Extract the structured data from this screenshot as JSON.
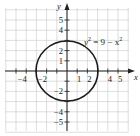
{
  "chart_data": {
    "type": "line",
    "title": "",
    "equation": "y² = 9 − x²",
    "curve": {
      "shape": "circle",
      "center": [
        0,
        0
      ],
      "radius": 3
    },
    "xlabel": "x",
    "ylabel": "y",
    "xlim": [
      -6,
      6
    ],
    "ylim": [
      -6,
      6
    ],
    "grid": true,
    "x_ticks": [
      -4,
      -2,
      1,
      2,
      4,
      5
    ],
    "y_ticks": [
      5,
      4,
      2,
      1,
      -2,
      -4,
      -5
    ],
    "x_tick_labels": [
      "−4",
      "−2",
      "1",
      "2",
      "4",
      "5"
    ],
    "y_tick_labels": [
      "5",
      "4",
      "2",
      "1",
      "−2",
      "−4",
      "−5"
    ],
    "legend": null
  },
  "labels": {
    "x_axis": "x",
    "y_axis": "y",
    "equation_lhs": "y",
    "equation_exp": "2",
    "equation_mid": " = 9 − x",
    "equation_exp2": "2"
  }
}
